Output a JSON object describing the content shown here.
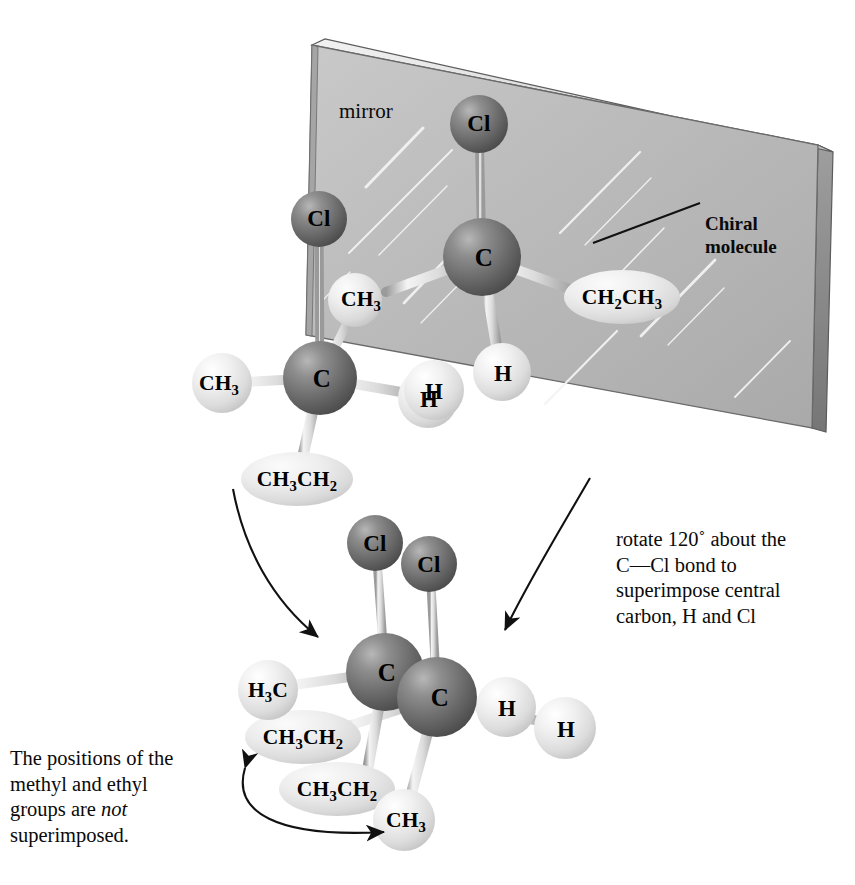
{
  "figure": {
    "mirror_label": "mirror",
    "callout_chiral": "Chiral molecule",
    "note_rotate": "rotate 120˚ about the C—Cl bond to superimpose central carbon, H and Cl",
    "note_rotate_lines": [
      "rotate 120˚ about the",
      "C—Cl bond to",
      "superimpose central",
      "carbon, H and Cl"
    ],
    "note_not_lines_pre": [
      "The positions of the",
      "methyl and ethyl",
      "groups are "
    ],
    "note_not_emphasis": "not",
    "note_not_tail": "superimposed.",
    "colors": {
      "dark_atom": "#6f6f6f",
      "light_atom": "#e3e3e3",
      "mirror_face": "#bdbdbd",
      "mirror_edge": "#8d8d8d",
      "bond": "#d8d8d8",
      "ink": "#0a0a0a"
    }
  },
  "molecules": {
    "reflection": {
      "name": "mirror-image-molecule",
      "atoms": [
        {
          "id": "cl",
          "label": "Cl",
          "kind": "dark",
          "x": 319,
          "y": 219,
          "r": 28
        },
        {
          "id": "c",
          "label": "C",
          "kind": "dark",
          "x": 320,
          "y": 378,
          "r": 37
        },
        {
          "id": "ch3_up",
          "label": "CH3",
          "kind": "light",
          "x": 355,
          "y": 300,
          "r": 27
        },
        {
          "id": "ch3_left",
          "label": "CH3",
          "kind": "light",
          "x": 222,
          "y": 383,
          "r": 30
        },
        {
          "id": "h_right",
          "label": "H",
          "kind": "light",
          "x": 428,
          "y": 398,
          "r": 30
        },
        {
          "id": "ch3ch2",
          "label": "CH3CH2",
          "kind": "ellipse",
          "x": 297,
          "y": 479,
          "rx": 56,
          "ry": 27
        }
      ],
      "bonds": [
        [
          "cl",
          "c"
        ],
        [
          "ch3_up",
          "c"
        ],
        [
          "ch3_left",
          "c"
        ],
        [
          "h_right",
          "c"
        ],
        [
          "ch3ch2",
          "c"
        ]
      ]
    },
    "chiral": {
      "name": "chiral-molecule",
      "atoms": [
        {
          "id": "cl",
          "label": "Cl",
          "kind": "dark",
          "x": 479,
          "y": 124,
          "r": 29
        },
        {
          "id": "c",
          "label": "C",
          "kind": "dark",
          "x": 482,
          "y": 257,
          "r": 39
        },
        {
          "id": "ch2ch3",
          "label": "CH2CH3",
          "kind": "ellipse",
          "x": 622,
          "y": 297,
          "rx": 58,
          "ry": 27
        },
        {
          "id": "h_lower",
          "label": "H",
          "kind": "light",
          "x": 502,
          "y": 372,
          "r": 29
        },
        {
          "id": "h_left",
          "label": "H",
          "kind": "light",
          "x": 434,
          "y": 390,
          "r": 30
        }
      ],
      "bonds": [
        [
          "cl",
          "c"
        ],
        [
          "ch2ch3",
          "c"
        ],
        [
          "h_lower",
          "c"
        ]
      ]
    },
    "rotated": {
      "name": "rotated-superimposed-pair",
      "atoms": [
        {
          "id": "cl_a",
          "label": "Cl",
          "kind": "dark",
          "x": 375,
          "y": 543,
          "r": 28
        },
        {
          "id": "cl_b",
          "label": "Cl",
          "kind": "dark",
          "x": 429,
          "y": 564,
          "r": 28
        },
        {
          "id": "c_a",
          "label": "C",
          "kind": "dark",
          "x": 385,
          "y": 672,
          "r": 39
        },
        {
          "id": "c_b",
          "label": "C",
          "kind": "dark",
          "x": 437,
          "y": 697,
          "r": 40
        },
        {
          "id": "h3c",
          "label": "H3C",
          "kind": "light",
          "x": 268,
          "y": 690,
          "r": 30
        },
        {
          "id": "ch3ch2_up",
          "label": "CH3CH2",
          "kind": "ellipse",
          "x": 303,
          "y": 737,
          "rx": 58,
          "ry": 27
        },
        {
          "id": "ch3ch2_low",
          "label": "CH3CH2",
          "kind": "ellipse",
          "x": 337,
          "y": 789,
          "rx": 58,
          "ry": 27
        },
        {
          "id": "ch3",
          "label": "CH3",
          "kind": "light",
          "x": 404,
          "y": 820,
          "r": 31
        },
        {
          "id": "h_a",
          "label": "H",
          "kind": "light",
          "x": 506,
          "y": 707,
          "r": 30
        },
        {
          "id": "h_b",
          "label": "H",
          "kind": "light",
          "x": 565,
          "y": 728,
          "r": 31
        }
      ],
      "bonds": [
        [
          "cl_a",
          "c_a"
        ],
        [
          "cl_b",
          "c_b"
        ],
        [
          "h3c",
          "c_a"
        ],
        [
          "ch3ch2_up",
          "c_b"
        ],
        [
          "ch3ch2_low",
          "c_a"
        ],
        [
          "ch3",
          "c_b"
        ],
        [
          "h_a",
          "c_b"
        ]
      ]
    }
  },
  "arrows": {
    "left_transform": "curved arrow from mirror-image molecule down to rotated pair",
    "right_transform": "curved arrow from chiral molecule down to rotated pair",
    "swap": "double-headed curved arrow between ethyl and methyl groups"
  }
}
